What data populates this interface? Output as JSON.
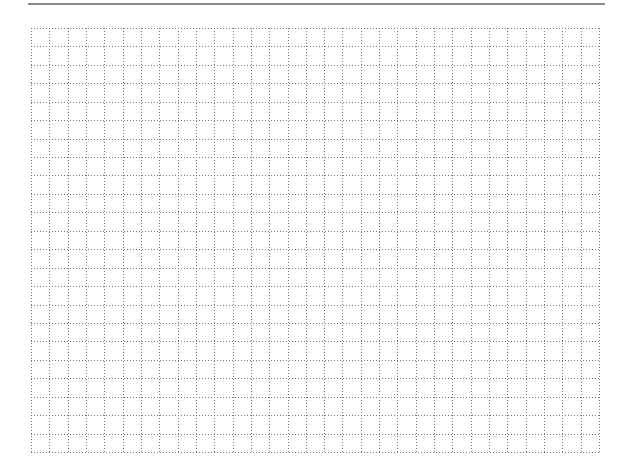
{
  "page": {
    "background": "#ffffff"
  },
  "top_rule": {
    "color": "#8a8a8a"
  },
  "grid": {
    "columns": 31,
    "rows": 23,
    "line_color": "#7a7a7a",
    "line_style": "dotted"
  }
}
